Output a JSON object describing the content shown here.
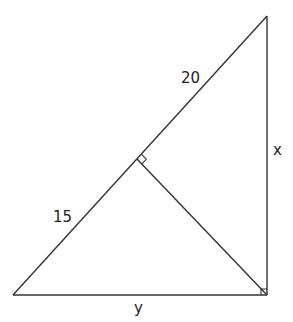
{
  "diagram": {
    "type": "right-triangle-with-altitude",
    "stroke_color": "#333333",
    "vertices": {
      "top": [
        267,
        16
      ],
      "bottom_left": [
        13,
        295
      ],
      "bottom_right": [
        267,
        295
      ],
      "altitude_foot": [
        137,
        159
      ]
    },
    "labels": {
      "upper_hypotenuse_segment": "20",
      "lower_hypotenuse_segment": "15",
      "vertical_leg": "x",
      "base": "y"
    },
    "right_angle_marks": [
      "altitude_foot",
      "bottom_right"
    ]
  }
}
